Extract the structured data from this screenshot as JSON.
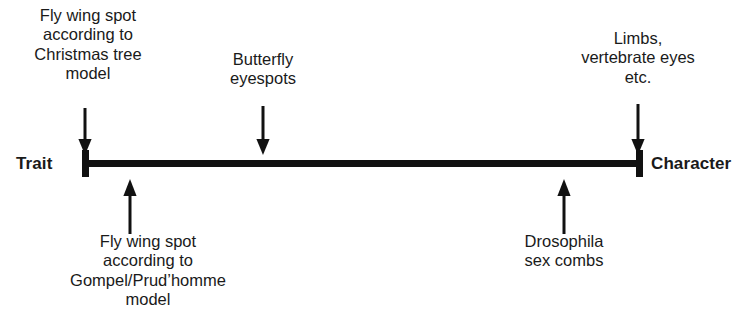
{
  "diagram": {
    "axis": {
      "left_pole_label": "Trait",
      "right_pole_label": "Character",
      "color": "#111111"
    },
    "annotations": [
      {
        "id": "christmas-tree",
        "side": "above",
        "arrow_direction": "down",
        "lines": [
          "Fly wing spot",
          "according to",
          "Christmas tree",
          "model"
        ]
      },
      {
        "id": "butterfly",
        "side": "above",
        "arrow_direction": "down",
        "lines": [
          "Butterfly",
          "eyespots"
        ]
      },
      {
        "id": "limbs",
        "side": "above",
        "arrow_direction": "down",
        "lines": [
          "Limbs,",
          "vertebrate eyes",
          "etc."
        ]
      },
      {
        "id": "gompel",
        "side": "below",
        "arrow_direction": "up",
        "lines": [
          "Fly wing spot",
          "according to",
          "Gompel/Prud’homme",
          "model"
        ]
      },
      {
        "id": "drosophila",
        "side": "below",
        "arrow_direction": "up",
        "lines": [
          "Drosophila",
          "sex combs"
        ]
      }
    ]
  }
}
